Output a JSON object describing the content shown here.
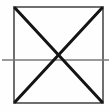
{
  "figure": {
    "title": "Square with both diagonals and a horizontal center line",
    "caption": "",
    "background_color": "#fefefe",
    "canvas": {
      "width": 110,
      "height": 112
    },
    "style": {
      "square_stroke_color": "#6f6f6f",
      "square_stroke_width": 2,
      "diagonal_stroke_color": "#141414",
      "diagonal_stroke_width": 3,
      "median_stroke_color": "#7a7a7a",
      "median_stroke_width": 1.6
    },
    "shapes": [
      {
        "name": "square-outline",
        "type": "rectangle",
        "label": "Square",
        "x": 14,
        "y": 7,
        "width": 89,
        "height": 96,
        "stroke": "#6f6f6f",
        "stroke_width": 2,
        "fill": "none"
      },
      {
        "name": "diagonal-top-left-to-bottom-right",
        "type": "line",
        "label": "Diagonal A",
        "x1": 15,
        "y1": 8,
        "x2": 102,
        "y2": 102,
        "stroke": "#141414",
        "stroke_width": 3
      },
      {
        "name": "diagonal-bottom-left-to-top-right",
        "type": "line",
        "label": "Diagonal B",
        "x1": 15,
        "y1": 102,
        "x2": 102,
        "y2": 8,
        "stroke": "#141414",
        "stroke_width": 3
      },
      {
        "name": "horizontal-median-line",
        "type": "line",
        "label": "Horizontal center line",
        "x1": 2,
        "y1": 60,
        "x2": 109,
        "y2": 60,
        "stroke": "#7a7a7a",
        "stroke_width": 1.6
      }
    ],
    "points": [
      {
        "name": "corner-top-left",
        "label": "",
        "x": 14,
        "y": 7
      },
      {
        "name": "corner-top-right",
        "label": "",
        "x": 103,
        "y": 7
      },
      {
        "name": "corner-bottom-left",
        "label": "",
        "x": 14,
        "y": 103
      },
      {
        "name": "corner-bottom-right",
        "label": "",
        "x": 103,
        "y": 103
      },
      {
        "name": "center-intersection",
        "label": "",
        "x": 58,
        "y": 60
      }
    ],
    "annotations": []
  }
}
